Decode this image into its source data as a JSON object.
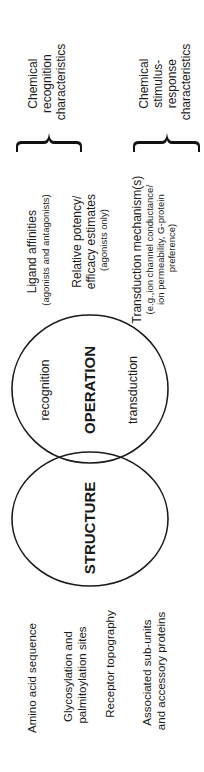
{
  "diagram": {
    "orientation": "rotated -90 degrees",
    "colors": {
      "ink": "#1a1a1a",
      "background": "#ffffff"
    },
    "structure_items": [
      {
        "lines": [
          "Amino acid sequence"
        ]
      },
      {
        "lines": [
          "Glycosylation and",
          "palmitoylation sites"
        ]
      },
      {
        "lines": [
          "Receptor topography"
        ]
      },
      {
        "lines": [
          "Associated sub-units",
          "and accessory proteins"
        ]
      }
    ],
    "circles": {
      "structure": {
        "label": "STRUCTURE"
      },
      "operation": {
        "label": "OPERATION",
        "left_label": "recognition",
        "right_label": "transduction"
      }
    },
    "operation_items": [
      {
        "lines": [
          "Ligand affinities"
        ],
        "sub": [
          "(agonists and antagonists)"
        ]
      },
      {
        "lines": [
          "Relative potency/",
          "efficacy estimates"
        ],
        "sub": [
          "(agonists only)"
        ]
      },
      {
        "lines": [
          "Transduction mechanism(s)"
        ],
        "sub": [
          "(e.g.,ion channel conductance/",
          "ion permeability, G-protein",
          "preference)"
        ]
      }
    ],
    "brace_groups": [
      {
        "lines": [
          "Chemical",
          "recognition",
          "characteristics"
        ]
      },
      {
        "lines": [
          "Chemical",
          "stimulus-",
          "response",
          "characteristics"
        ]
      }
    ]
  }
}
